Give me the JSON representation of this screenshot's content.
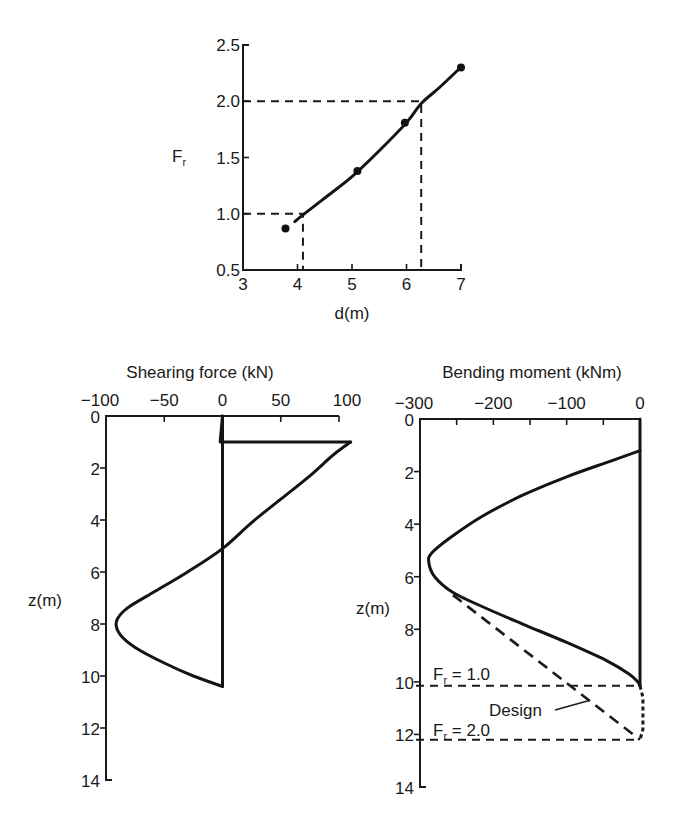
{
  "chart_data": [
    {
      "id": "fr-vs-depth",
      "type": "line",
      "title": "",
      "xlabel": "d(m)",
      "ylabel": "F_r",
      "ylabel_main": "F",
      "ylabel_sub": "r",
      "xlim": [
        3,
        7
      ],
      "ylim": [
        0.5,
        2.5
      ],
      "xticks": [
        3,
        4,
        5,
        6,
        7
      ],
      "yticks": [
        0.5,
        1.0,
        1.5,
        2.0,
        2.5
      ],
      "xtick_labels": [
        "3",
        "4",
        "5",
        "6",
        "7"
      ],
      "ytick_labels": [
        "0.5",
        "1.0",
        "1.5",
        "2.0",
        "2.5"
      ],
      "grid": false,
      "series": [
        {
          "name": "data points",
          "kind": "scatter",
          "x": [
            3.78,
            5.1,
            5.97,
            7.0
          ],
          "y": [
            0.87,
            1.38,
            1.81,
            2.3
          ]
        },
        {
          "name": "fitted curve",
          "kind": "line",
          "x": [
            3.95,
            4.1,
            4.5,
            5.0,
            5.5,
            6.0,
            6.27,
            6.6,
            6.95
          ],
          "y": [
            0.93,
            0.99,
            1.14,
            1.33,
            1.56,
            1.81,
            1.98,
            2.12,
            2.28
          ]
        }
      ],
      "annotations": [
        {
          "type": "reference",
          "fr": 1.0,
          "d": 4.1
        },
        {
          "type": "reference",
          "fr": 2.0,
          "d": 6.27
        }
      ]
    },
    {
      "id": "shearing-force",
      "type": "line",
      "title": "Shearing force (kN)",
      "xlabel": "Shearing force (kN)",
      "ylabel": "z(m)",
      "xlim": [
        -100,
        100
      ],
      "ylim": [
        14,
        0
      ],
      "xticks": [
        -100,
        -50,
        0,
        50,
        100
      ],
      "xtick_labels": [
        "−100",
        "−50",
        "0",
        "50",
        "100"
      ],
      "yticks": [
        0,
        2,
        4,
        6,
        8,
        10,
        12,
        14
      ],
      "ytick_labels": [
        "0",
        "2",
        "4",
        "6",
        "8",
        "10",
        "12",
        "14"
      ],
      "grid": false,
      "series": [
        {
          "name": "shearing force",
          "x": [
            0,
            -2,
            110,
            95,
            75,
            50,
            25,
            0,
            -30,
            -60,
            -82,
            -91,
            -88,
            -75,
            -50,
            -25,
            0,
            0
          ],
          "z": [
            0,
            1.0,
            1.0,
            1.5,
            2.3,
            3.2,
            4.1,
            5.1,
            6.0,
            6.8,
            7.4,
            7.9,
            8.4,
            8.9,
            9.5,
            10.0,
            10.4,
            0
          ]
        }
      ]
    },
    {
      "id": "bending-moment",
      "type": "line",
      "title": "Bending moment (kNm)",
      "xlabel": "Bending moment (kNm)",
      "ylabel": "z(m)",
      "xlim": [
        -300,
        0
      ],
      "ylim": [
        14,
        0
      ],
      "xticks": [
        -300,
        -250,
        -200,
        -150,
        -100,
        -50,
        0
      ],
      "xtick_labels": [
        "−300",
        "",
        "−200",
        "",
        "−100",
        "",
        "0"
      ],
      "yticks": [
        0,
        2,
        4,
        6,
        8,
        10,
        12,
        14
      ],
      "ytick_labels": [
        "0",
        "2",
        "4",
        "6",
        "8",
        "10",
        "12",
        "14"
      ],
      "grid": false,
      "series": [
        {
          "name": "bending moment",
          "x": [
            0,
            -40,
            -100,
            -160,
            -215,
            -258,
            -284,
            -288,
            -280,
            -255,
            -210,
            -160,
            -100,
            -45,
            -15,
            -3,
            0
          ],
          "z": [
            1.2,
            1.6,
            2.2,
            2.9,
            3.7,
            4.5,
            5.1,
            5.45,
            6.0,
            6.6,
            7.2,
            7.8,
            8.5,
            9.2,
            9.7,
            10.0,
            10.15
          ]
        },
        {
          "name": "Design",
          "style": "dashed",
          "x": [
            -255,
            0
          ],
          "z": [
            6.7,
            12.2
          ]
        },
        {
          "name": "tail",
          "style": "dotted",
          "x": [
            0,
            4,
            4,
            0
          ],
          "z": [
            10.15,
            10.6,
            11.8,
            12.2
          ]
        }
      ],
      "annotations": [
        {
          "type": "hline",
          "z": 10.15,
          "label": "F_r = 1.0",
          "label_main": "F",
          "label_sub": "r",
          "label_rest": " = 1.0"
        },
        {
          "type": "hline",
          "z": 12.2,
          "label": "F_r = 2.0",
          "label_main": "F",
          "label_sub": "r",
          "label_rest": " = 2.0"
        },
        {
          "type": "label",
          "text": "Design",
          "pointer_to": {
            "x": -68,
            "z": 10.7
          }
        }
      ]
    }
  ]
}
